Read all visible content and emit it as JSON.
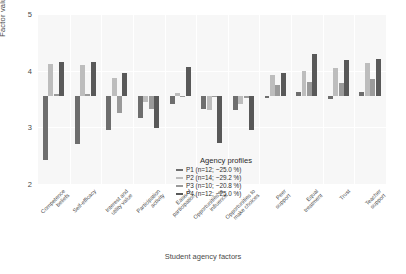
{
  "chart_data": {
    "type": "bar",
    "title": "",
    "xlabel": "Student agency factors",
    "ylabel": "Factor value",
    "ylim": [
      2,
      5
    ],
    "yticks": [
      2,
      3,
      4,
      5
    ],
    "grid": true,
    "baseline": 3.55,
    "orientation": "vertical-grouped-deviation",
    "legend_position": "inside-center-bottom",
    "legend_title": "Agency profiles",
    "categories": [
      "Competence\nbeliefs",
      "Self-efficacy",
      "Interest and\nutility value",
      "Participation\nactivity",
      "Ease of\nparticipation",
      "Opportunities to\ninfluence",
      "Opportunities to\nmake choices",
      "Peer\nsupport",
      "Equal\ntreatment",
      "Trust",
      "Teacher\nsupport"
    ],
    "series": [
      {
        "name": "P1 (n=12; ~25.0 %)",
        "short": "P1",
        "n": 12,
        "percent": "~25.0 %",
        "color": "#6e6e6e",
        "values": [
          2.42,
          2.7,
          2.95,
          3.17,
          3.42,
          3.33,
          3.3,
          3.52,
          3.62,
          3.5,
          3.62
        ]
      },
      {
        "name": "P2 (n=14; ~29.2 %)",
        "short": "P2",
        "n": 14,
        "percent": "~29.2 %",
        "color": "#bdbdbd",
        "values": [
          4.12,
          4.1,
          3.87,
          3.45,
          3.6,
          3.3,
          3.42,
          3.92,
          4.0,
          4.05,
          4.14
        ]
      },
      {
        "name": "P3 (n=10; ~20.8 %)",
        "short": "P3",
        "n": 10,
        "percent": "~20.8 %",
        "color": "#9a9a9a",
        "values": [
          3.58,
          3.58,
          3.25,
          3.32,
          3.56,
          3.56,
          3.52,
          3.74,
          3.8,
          3.78,
          3.86
        ]
      },
      {
        "name": "P4 (n=12; ~25.0 %)",
        "short": "P4",
        "n": 12,
        "percent": "~25.0 %",
        "color": "#595959",
        "values": [
          4.16,
          4.15,
          3.96,
          2.98,
          4.07,
          2.72,
          2.95,
          3.96,
          4.3,
          4.18,
          4.2
        ]
      }
    ]
  },
  "axes": {
    "y_label": "Factor value",
    "x_label": "Student agency factors",
    "y_ticks": [
      "5",
      "4",
      "3",
      "2"
    ]
  },
  "legend": {
    "title": "Agency profiles",
    "entries": [
      {
        "label": "P1 (n=12; ~25.0 %)",
        "color": "#6e6e6e"
      },
      {
        "label": "P2 (n=14; ~29.2 %)",
        "color": "#bdbdbd"
      },
      {
        "label": "P3 (n=10; ~20.8 %)",
        "color": "#9a9a9a"
      },
      {
        "label": "P4 (n=12; ~25.0 %)",
        "color": "#595959"
      }
    ]
  }
}
